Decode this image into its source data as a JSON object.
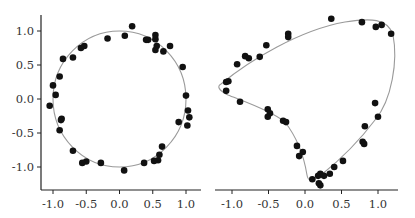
{
  "chart_data": [
    {
      "type": "scatter",
      "title": "",
      "xlabel": "",
      "ylabel": "",
      "xlim": [
        -1.2,
        1.2
      ],
      "ylim": [
        -1.35,
        1.25
      ],
      "xticks": [
        "-1.0",
        "-0.5",
        "0.0",
        "0.5",
        "1.0"
      ],
      "yticks": [
        "1.0",
        "0.5",
        "0.0",
        "-0.5",
        "-1.0"
      ],
      "grid": false,
      "curve": {
        "name": "fitted curve",
        "shape": "unit circle",
        "color": "#9a9a9a"
      },
      "series": [
        {
          "name": "samples",
          "color": "#111111",
          "points": [
            [
              0.19,
              1.07
            ],
            [
              0.08,
              0.93
            ],
            [
              -0.18,
              0.89
            ],
            [
              0.54,
              0.94
            ],
            [
              0.54,
              0.88
            ],
            [
              0.4,
              0.87
            ],
            [
              0.43,
              0.87
            ],
            [
              0.56,
              0.78
            ],
            [
              0.54,
              0.72
            ],
            [
              0.66,
              0.7
            ],
            [
              0.76,
              0.78
            ],
            [
              0.95,
              0.47
            ],
            [
              1.0,
              0.05
            ],
            [
              1.03,
              -0.17
            ],
            [
              1.05,
              -0.27
            ],
            [
              1.02,
              -0.39
            ],
            [
              0.89,
              -0.34
            ],
            [
              0.64,
              -0.7
            ],
            [
              0.6,
              -0.82
            ],
            [
              0.58,
              -0.9
            ],
            [
              0.52,
              -0.91
            ],
            [
              0.37,
              -0.94
            ],
            [
              0.07,
              -1.05
            ],
            [
              -0.28,
              -0.94
            ],
            [
              -0.5,
              -0.92
            ],
            [
              -0.56,
              -0.94
            ],
            [
              -0.7,
              -0.76
            ],
            [
              -0.9,
              -0.46
            ],
            [
              -0.87,
              -0.29
            ],
            [
              -0.88,
              -0.31
            ],
            [
              -1.05,
              -0.1
            ],
            [
              -0.96,
              0.06
            ],
            [
              -1.0,
              0.2
            ],
            [
              -0.9,
              0.33
            ],
            [
              -0.85,
              0.59
            ],
            [
              -0.7,
              0.61
            ],
            [
              -0.58,
              0.75
            ],
            [
              -0.53,
              0.78
            ]
          ]
        }
      ]
    },
    {
      "type": "scatter",
      "title": "",
      "xlabel": "",
      "ylabel": "",
      "xlim": [
        -1.2,
        1.25
      ],
      "ylim": [
        -1.35,
        1.25
      ],
      "xticks": [
        "-1.0",
        "-0.5",
        "0.0",
        "0.5",
        "1.0"
      ],
      "yticks": [],
      "grid": false,
      "curve": {
        "name": "fitted curve",
        "shape": "closed skewed loop",
        "color": "#9a9a9a"
      },
      "series": [
        {
          "name": "samples",
          "color": "#111111",
          "points": [
            [
              0.36,
              1.18
            ],
            [
              0.78,
              1.13
            ],
            [
              0.97,
              1.06
            ],
            [
              1.05,
              1.09
            ],
            [
              1.18,
              0.96
            ],
            [
              -0.23,
              0.96
            ],
            [
              -0.23,
              0.91
            ],
            [
              -0.53,
              0.79
            ],
            [
              -0.62,
              0.62
            ],
            [
              -0.82,
              0.63
            ],
            [
              -0.77,
              0.6
            ],
            [
              -0.93,
              0.51
            ],
            [
              -1.05,
              0.26
            ],
            [
              -1.08,
              0.25
            ],
            [
              -1.08,
              0.12
            ],
            [
              -0.89,
              -0.04
            ],
            [
              -0.51,
              -0.15
            ],
            [
              -0.48,
              -0.21
            ],
            [
              -0.51,
              -0.26
            ],
            [
              -0.3,
              -0.32
            ],
            [
              -0.26,
              -0.34
            ],
            [
              -0.11,
              -0.69
            ],
            [
              -0.03,
              -0.78
            ],
            [
              -0.08,
              -0.84
            ],
            [
              0.1,
              -1.18
            ],
            [
              0.18,
              -1.13
            ],
            [
              0.21,
              -1.1
            ],
            [
              0.26,
              -1.13
            ],
            [
              0.21,
              -1.27
            ],
            [
              0.19,
              -1.24
            ],
            [
              0.34,
              -1.1
            ],
            [
              0.4,
              -1.0
            ],
            [
              0.52,
              -0.91
            ],
            [
              0.79,
              -0.63
            ],
            [
              0.81,
              -0.66
            ],
            [
              0.82,
              -0.4
            ],
            [
              0.96,
              -0.06
            ],
            [
              1.0,
              -0.26
            ]
          ]
        }
      ]
    }
  ],
  "panels": [
    {
      "x_ticks": [
        {
          "value": -1.0,
          "label": "-1.0"
        },
        {
          "value": -0.5,
          "label": "-0.5"
        },
        {
          "value": 0.0,
          "label": "0.0"
        },
        {
          "value": 0.5,
          "label": "0.5"
        },
        {
          "value": 1.0,
          "label": "1.0"
        }
      ],
      "y_ticks": [
        {
          "value": 1.0,
          "label": "1.0"
        },
        {
          "value": 0.5,
          "label": "0.5"
        },
        {
          "value": 0.0,
          "label": "0.0"
        },
        {
          "value": -0.5,
          "label": "-0.5"
        },
        {
          "value": -1.0,
          "label": "-1.0"
        }
      ]
    },
    {
      "x_ticks": [
        {
          "value": -1.0,
          "label": "-1.0"
        },
        {
          "value": -0.5,
          "label": "-0.5"
        },
        {
          "value": 0.0,
          "label": "0.0"
        },
        {
          "value": 0.5,
          "label": "0.5"
        },
        {
          "value": 1.0,
          "label": "1.0"
        }
      ]
    }
  ],
  "colors": {
    "axis": "#222222",
    "curve": "#9a9a9a",
    "point": "#111111",
    "text": "#333333"
  }
}
